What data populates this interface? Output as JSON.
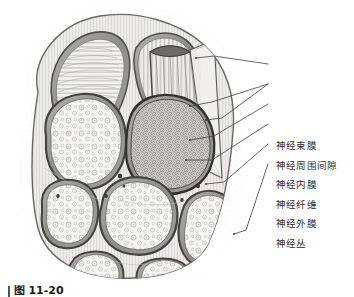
{
  "figure": {
    "style": "grayscale pen-and-ink anatomical illustration",
    "caption_bar": "",
    "caption_text": "图 11-20"
  },
  "labels": [
    {
      "id": "perineurium",
      "text": "神经束膜"
    },
    {
      "id": "perineural-space",
      "text": "神经周围间隙"
    },
    {
      "id": "endoneurium",
      "text": "神经内膜"
    },
    {
      "id": "nerve-fiber",
      "text": "神经纤维"
    },
    {
      "id": "epineurium",
      "text": "神经外膜"
    },
    {
      "id": "nerve-plexus",
      "text": "神经丛"
    }
  ],
  "colors": {
    "ink": "#2b2b2b",
    "outline": "#3a3a3a",
    "fascicle_light": "#f4f3f1",
    "fascicle_dark": "#b9b7b4",
    "sheath": "#9c9a97",
    "epineurium_fill": "#e6e4e1",
    "stipple": "#bdbbb8",
    "background": "#ffffff",
    "leader": "#4a4a4a"
  },
  "structures": {
    "fascicles": [
      {
        "id": "fascicle-upper-left-striated",
        "fill": "light",
        "texture": "transverse-striations"
      },
      {
        "id": "fascicle-upper-right-flap",
        "fill": "light",
        "texture": "longitudinal-striations"
      },
      {
        "id": "fascicle-left",
        "fill": "light",
        "texture": "sparse-myelinated-circles"
      },
      {
        "id": "fascicle-center-dark",
        "fill": "dark",
        "texture": "dense-myelinated-circles"
      },
      {
        "id": "fascicle-lower-left",
        "fill": "light",
        "texture": "sparse-myelinated-circles"
      },
      {
        "id": "fascicle-lower-center",
        "fill": "light",
        "texture": "sparse-myelinated-circles"
      },
      {
        "id": "fascicle-lower-right",
        "fill": "light",
        "texture": "sparse-myelinated-circles"
      },
      {
        "id": "fascicle-bottom-edge-a",
        "fill": "light",
        "texture": "plain"
      },
      {
        "id": "fascicle-bottom-edge-b",
        "fill": "light",
        "texture": "plain"
      }
    ],
    "flap": {
      "id": "perineurium-peeled-flap",
      "description": "reflected perineurium sheet with longitudinal fibers"
    }
  }
}
